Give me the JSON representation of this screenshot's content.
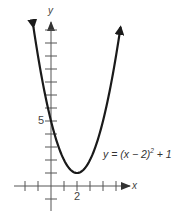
{
  "chart_data": {
    "type": "line",
    "title": "",
    "function": "y = (x - 2)^2 + 1",
    "xlabel": "x",
    "ylabel": "y",
    "xlim": [
      -2,
      6.5
    ],
    "ylim": [
      -2,
      13
    ],
    "grid": false,
    "legend": null,
    "vertex": {
      "x": 2,
      "y": 1
    },
    "x_ticks": [
      -2,
      -1,
      0,
      1,
      2,
      3,
      4,
      5
    ],
    "x_tick_labels": [
      {
        "value": 2,
        "label": "2"
      }
    ],
    "y_ticks": [
      -1,
      1,
      2,
      3,
      4,
      5,
      6,
      7,
      8,
      9,
      10,
      11,
      12
    ],
    "y_tick_labels": [
      {
        "value": 5,
        "label": "5"
      }
    ],
    "series": [
      {
        "name": "y = (x − 2)² + 1",
        "x": [
          -1.4,
          -1,
          0,
          1,
          2,
          3,
          4,
          5,
          5.4
        ],
        "y": [
          12.56,
          10,
          5,
          2,
          1,
          2,
          5,
          10,
          12.56
        ]
      }
    ],
    "annotations": [
      {
        "text": "y = (x − 2)² + 1",
        "position": "right of curve, near vertex"
      }
    ],
    "arrows": "curve ends have arrowheads; axes have arrowheads on positive y and positive x"
  },
  "labels": {
    "y_axis": "y",
    "x_axis": "x",
    "tick_5": "5",
    "tick_2": "2",
    "equation_prefix": "y = (x − 2)",
    "equation_exp": "2",
    "equation_suffix": " + 1"
  },
  "colors": {
    "axis": "#555555",
    "curve": "#1a1a1a",
    "text": "#444444"
  }
}
